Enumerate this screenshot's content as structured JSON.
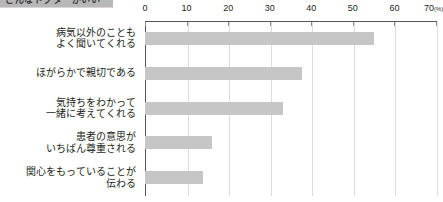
{
  "header": {
    "banner_text": "こんなドクターがいい"
  },
  "chart_data": {
    "type": "bar",
    "orientation": "horizontal",
    "title": "",
    "subtitle": "",
    "xlabel": "",
    "ylabel": "",
    "unit_label": "(%)",
    "xlim": [
      0,
      70
    ],
    "grid": true,
    "legend": "none",
    "tick_values": [
      0,
      10,
      20,
      30,
      40,
      50,
      60,
      70
    ],
    "tick_labels": [
      "0",
      "10",
      "20",
      "30",
      "40",
      "50",
      "60",
      "70"
    ],
    "bar_color": "#c6c6c6",
    "categories": [
      "病気以外のことも\nよく聞いてくれる",
      "ほがらかで親切である",
      "気持ちをわかって\n一緒に考えてくれる",
      "患者の意思が\nいちばん尊重される",
      "関心をもっていることが\n伝わる"
    ],
    "values": [
      55.0,
      37.7,
      33.2,
      16.0,
      14.0
    ]
  }
}
